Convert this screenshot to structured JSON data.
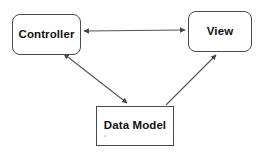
{
  "diagram": {
    "background_color": "#fefefe",
    "line_color": "#555555",
    "border_color": "#4a4a4a",
    "text_color": "#111111",
    "nodes": [
      {
        "id": "controller",
        "label": "Controller",
        "shape": "rounded-rectangle",
        "x": 12,
        "y": 14,
        "width": 69,
        "height": 41
      },
      {
        "id": "view",
        "label": "View",
        "shape": "rounded-rectangle",
        "x": 188,
        "y": 11,
        "width": 64,
        "height": 41
      },
      {
        "id": "datamodel",
        "label": "Data Model",
        "shape": "rectangle",
        "x": 96,
        "y": 106,
        "width": 78,
        "height": 40
      }
    ],
    "edges": [
      {
        "id": "controller-view",
        "from": "controller",
        "to": "view",
        "direction": "bidirectional",
        "style": "straight-horizontal"
      },
      {
        "id": "controller-datamodel",
        "from": "controller",
        "to": "datamodel",
        "direction": "bidirectional",
        "style": "straight-diagonal"
      },
      {
        "id": "datamodel-view",
        "from": "datamodel",
        "to": "view",
        "direction": "unidirectional",
        "style": "straight-diagonal"
      }
    ]
  }
}
